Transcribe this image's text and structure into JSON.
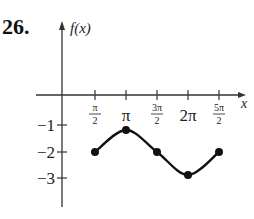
{
  "problem_number": "26.",
  "chart_data": {
    "type": "line",
    "title": "",
    "xlabel": "x",
    "ylabel": "f(x)",
    "x_tick_labels": [
      {
        "num": "π",
        "den": "2"
      },
      {
        "text": "π"
      },
      {
        "num": "3π",
        "den": "2"
      },
      {
        "text": "2π"
      },
      {
        "num": "5π",
        "den": "2"
      }
    ],
    "y_tick_labels": [
      "−1",
      "−2",
      "−3"
    ],
    "x": [
      "π/2",
      "π",
      "3π/2",
      "2π",
      "5π/2"
    ],
    "x_values": [
      1.5708,
      3.1416,
      4.7124,
      6.2832,
      7.854
    ],
    "values": [
      -2,
      -1.2,
      -2,
      -2.8,
      -2
    ],
    "marked_points": true,
    "grid": false,
    "legend": "none",
    "ylim": [
      -4,
      0.5
    ],
    "colors": {
      "line": "#111111",
      "axis": "#333333"
    }
  }
}
